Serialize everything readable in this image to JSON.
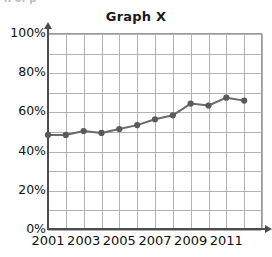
{
  "page": {
    "top_artifact_text": "h of p"
  },
  "chart_data": {
    "type": "line",
    "title": "Graph X",
    "xlabel": "",
    "ylabel": "",
    "x": [
      2001,
      2002,
      2003,
      2004,
      2005,
      2006,
      2007,
      2008,
      2009,
      2010,
      2011,
      2012
    ],
    "values": [
      48,
      48,
      50,
      49,
      51,
      53,
      56,
      58,
      64,
      63,
      67,
      65.5
    ],
    "series": [
      {
        "name": "Graph X",
        "values": [
          48,
          48,
          50,
          49,
          51,
          53,
          56,
          58,
          64,
          63,
          67,
          65.5
        ]
      }
    ],
    "ylim": [
      0,
      100
    ],
    "xlim": [
      2001,
      2013
    ],
    "y_tick_labels": [
      "100%",
      "80%",
      "60%",
      "40%",
      "20%",
      "0%"
    ],
    "y_tick_values": [
      100,
      80,
      60,
      40,
      20,
      0
    ],
    "x_tick_labels": [
      "2001",
      "2003",
      "2005",
      "2007",
      "2009",
      "2011"
    ],
    "x_tick_values": [
      2001,
      2003,
      2005,
      2007,
      2009,
      2011
    ],
    "y_gridline_values": [
      100,
      90,
      80,
      70,
      60,
      50,
      40,
      30,
      20,
      10,
      0
    ],
    "x_gridline_values": [
      2001,
      2002,
      2003,
      2004,
      2005,
      2006,
      2007,
      2008,
      2009,
      2010,
      2011,
      2012,
      2013
    ],
    "grid": true,
    "legend": false,
    "legend_position": "none",
    "line_color": "#6b6b6b",
    "marker_color": "#5a5a5a",
    "marker_shape": "circle",
    "grid_color": "#b2b2b2",
    "axis_color": "#4d4d4d",
    "text_color": "#111111",
    "background_color": "#ffffff"
  }
}
